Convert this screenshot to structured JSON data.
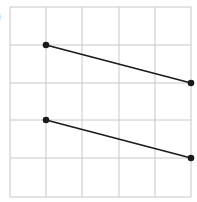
{
  "figure": {
    "label": ")",
    "grid": {
      "columns": 5,
      "rows": 5,
      "x_lines": [
        10,
        46,
        82,
        119,
        155,
        191
      ],
      "y_lines": [
        7,
        45,
        83,
        120,
        158,
        197
      ],
      "line_color": "#c8c8c8"
    },
    "segments": [
      {
        "name": "upper-segment",
        "from": [
          1,
          1
        ],
        "to": [
          5,
          2
        ]
      },
      {
        "name": "lower-segment",
        "from": [
          1,
          3
        ],
        "to": [
          5,
          4
        ]
      }
    ],
    "stroke_color": "#1a1a1a"
  }
}
